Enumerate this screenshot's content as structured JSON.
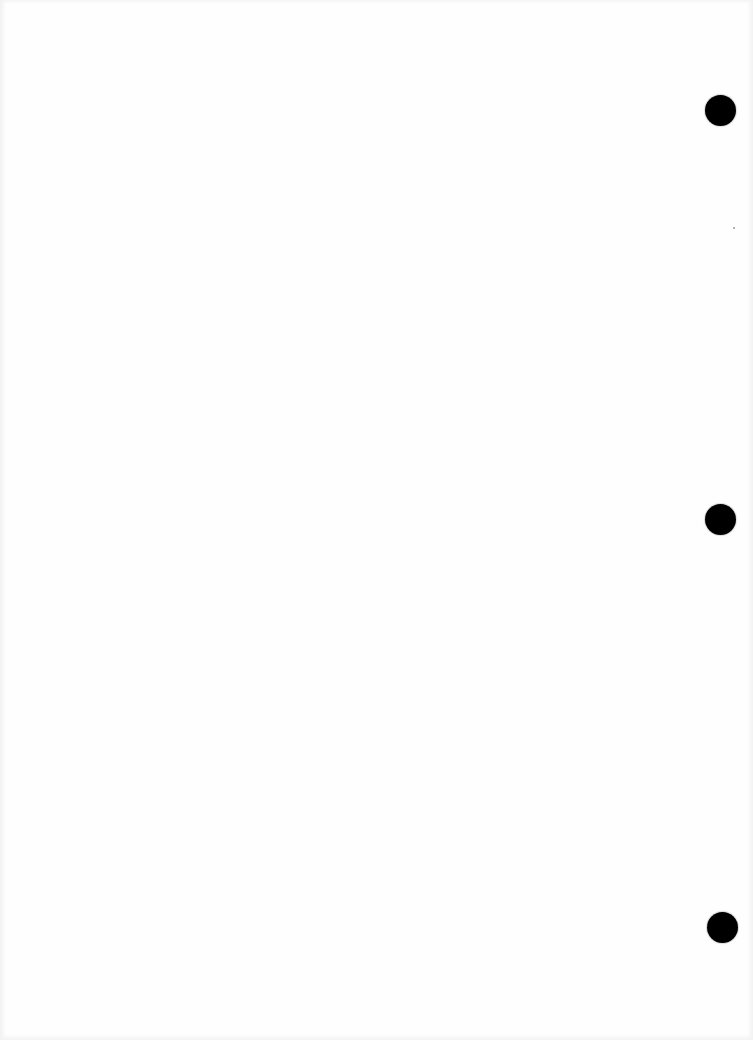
{
  "document": {
    "type": "blank scanned page",
    "text": "",
    "colors": {
      "paper": "#fefefe",
      "punch_hole": "#000000"
    },
    "punch_holes": [
      {
        "cx": 720,
        "cy": 110,
        "diameter": 31
      },
      {
        "cx": 720,
        "cy": 519,
        "diameter": 31
      },
      {
        "cx": 722,
        "cy": 927,
        "diameter": 31
      }
    ],
    "specks": [
      {
        "x": 734,
        "y": 228
      }
    ]
  }
}
